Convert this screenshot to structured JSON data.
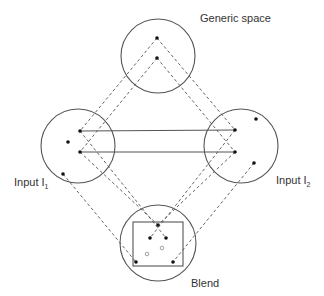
{
  "diagram": {
    "labels": {
      "generic": "Generic space",
      "input1": "Input  I",
      "input1_sub": "1",
      "input2": "Input  I",
      "input2_sub": "2",
      "blend": "Blend"
    },
    "colors": {
      "stroke": "#555555",
      "dot": "#111111",
      "hollow": "#888888"
    },
    "circles": [
      {
        "name": "generic-space-circle",
        "cx": 158,
        "cy": 56,
        "r": 37
      },
      {
        "name": "input1-circle",
        "cx": 78,
        "cy": 146,
        "r": 37
      },
      {
        "name": "input2-circle",
        "cx": 241,
        "cy": 146,
        "r": 37
      },
      {
        "name": "blend-circle",
        "cx": 158,
        "cy": 243,
        "r": 38
      }
    ],
    "blend_frame": {
      "x": 133,
      "y": 222,
      "w": 50,
      "h": 44
    },
    "dots": [
      {
        "x": 157,
        "y": 38
      },
      {
        "x": 157,
        "y": 58
      },
      {
        "x": 80,
        "y": 131
      },
      {
        "x": 68,
        "y": 142
      },
      {
        "x": 80,
        "y": 152
      },
      {
        "x": 63,
        "y": 174
      },
      {
        "x": 235,
        "y": 130
      },
      {
        "x": 256,
        "y": 119
      },
      {
        "x": 235,
        "y": 152
      },
      {
        "x": 254,
        "y": 163
      },
      {
        "x": 158,
        "y": 225
      },
      {
        "x": 150,
        "y": 238
      },
      {
        "x": 166,
        "y": 238
      },
      {
        "x": 136,
        "y": 262
      },
      {
        "x": 173,
        "y": 262
      }
    ],
    "hollow_dots": [
      {
        "x": 147,
        "y": 254
      },
      {
        "x": 162,
        "y": 248
      }
    ],
    "solid_lines": [
      {
        "x1": 80,
        "y1": 131,
        "x2": 235,
        "y2": 130
      },
      {
        "x1": 80,
        "y1": 152,
        "x2": 235,
        "y2": 152
      }
    ],
    "dashed_lines": [
      {
        "x1": 157,
        "y1": 38,
        "x2": 80,
        "y2": 131
      },
      {
        "x1": 157,
        "y1": 58,
        "x2": 80,
        "y2": 152
      },
      {
        "x1": 157,
        "y1": 38,
        "x2": 235,
        "y2": 130
      },
      {
        "x1": 157,
        "y1": 58,
        "x2": 235,
        "y2": 152
      },
      {
        "x1": 80,
        "y1": 131,
        "x2": 166,
        "y2": 238
      },
      {
        "x1": 80,
        "y1": 152,
        "x2": 158,
        "y2": 225
      },
      {
        "x1": 63,
        "y1": 174,
        "x2": 136,
        "y2": 262
      },
      {
        "x1": 235,
        "y1": 130,
        "x2": 150,
        "y2": 238
      },
      {
        "x1": 235,
        "y1": 152,
        "x2": 158,
        "y2": 225
      },
      {
        "x1": 254,
        "y1": 163,
        "x2": 173,
        "y2": 262
      }
    ]
  }
}
